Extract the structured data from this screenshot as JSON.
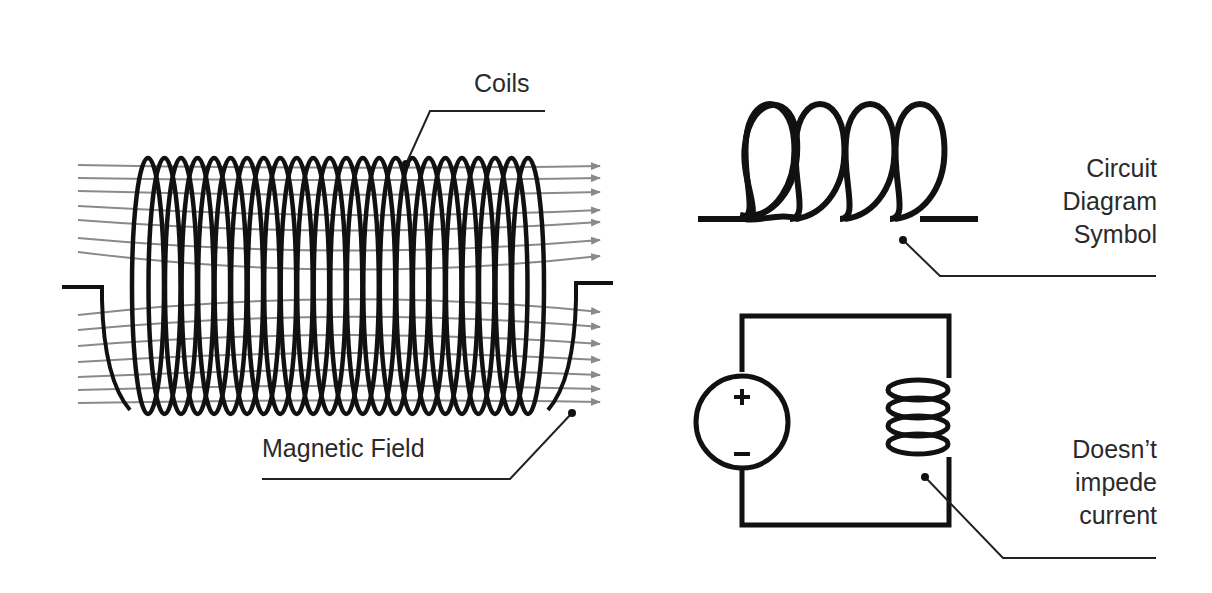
{
  "diagram": {
    "labels": {
      "coils": "Coils",
      "magnetic_field": "Magnetic Field",
      "circuit_symbol": [
        "Circuit",
        "Diagram",
        "Symbol"
      ],
      "doesnt_impede": [
        "Doesn’t",
        "impede",
        "current"
      ]
    },
    "solenoid": {
      "turns": 24
    },
    "symbol": {
      "loops": 4
    },
    "circuit": {
      "source_plus": "+",
      "source_minus": "–",
      "inductor_loops": 4
    },
    "colors": {
      "ink": "#111111",
      "field": "#8a8a8a",
      "text": "#2a2a2a",
      "background": "#ffffff"
    }
  }
}
